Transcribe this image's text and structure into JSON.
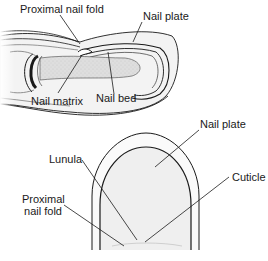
{
  "figure": {
    "side_view": {
      "labels": {
        "proximal_nail_fold": "Proximal nail fold",
        "nail_plate": "Nail plate",
        "nail_matrix": "Nail matrix",
        "nail_bed": "Nail bed"
      }
    },
    "top_view": {
      "labels": {
        "nail_plate": "Nail plate",
        "lunula": "Lunula",
        "cuticle": "Cuticle",
        "proximal_nail_fold_line1": "Proximal",
        "proximal_nail_fold_line2": "nail fold"
      }
    }
  },
  "colors": {
    "line": "#1a1a1a",
    "fill_light": "#f2f2f2",
    "fill_mid": "#e3e3e3",
    "fill_dark": "#bdbdbd"
  }
}
